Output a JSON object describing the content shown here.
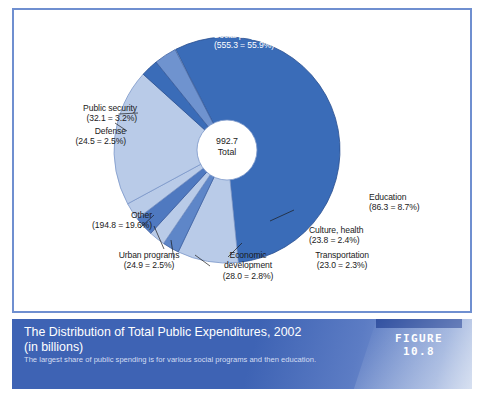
{
  "figure": {
    "label": "FIGURE 10.8",
    "title": "The Distribution of Total Public Expenditures, 2002 (in  billions)",
    "title_line1": "The Distribution of Total Public Expenditures, 2002",
    "title_line2": "(in  billions)",
    "subtitle": "The largest share of public spending is for various social programs and then education.",
    "accent_color": "#3e63b4",
    "bar_color": "#2f4fa0",
    "frame_color": "#6f8fd0"
  },
  "center": {
    "value": "992.7",
    "label": "Total"
  },
  "chart_data": {
    "type": "pie",
    "title": "The Distribution of Total Public Expenditures, 2002 (in  billions)",
    "subtitle": "The largest share of public spending is for various social programs and then education.",
    "units": "billions of dollars",
    "total": 992.7,
    "total_label": "992.7 Total",
    "legend": "labels-with-leader-lines",
    "categories": [
      "Social programs",
      "Education",
      "Culture, health",
      "Transportation",
      "Economic development",
      "Urban programs",
      "Other",
      "Defense",
      "Public security"
    ],
    "values": [
      555.3,
      86.3,
      23.8,
      23.0,
      28.0,
      24.9,
      194.8,
      24.5,
      32.1
    ],
    "percents": [
      55.9,
      8.7,
      2.4,
      2.3,
      2.8,
      2.5,
      19.6,
      2.5,
      3.2
    ],
    "colors": [
      "#3a6cb8",
      "#b9cbe8",
      "#5e86c8",
      "#b9cbe8",
      "#4f79c0",
      "#b9cbe8",
      "#b9cbe8",
      "#3a6cb8",
      "#6f93cf"
    ],
    "slices": [
      {
        "name": "Social programs",
        "value": 555.3,
        "percent": 55.9,
        "label": "Social programs",
        "value_label": "(555.3 = 55.9%)",
        "color": "#3a6cb8"
      },
      {
        "name": "Education",
        "value": 86.3,
        "percent": 8.7,
        "label": "Education",
        "value_label": "(86.3 = 8.7%)",
        "color": "#b9cbe8"
      },
      {
        "name": "Culture, health",
        "value": 23.8,
        "percent": 2.4,
        "label": "Culture, health",
        "value_label": "(23.8 = 2.4%)",
        "color": "#5e86c8"
      },
      {
        "name": "Transportation",
        "value": 23.0,
        "percent": 2.3,
        "label": "Transportation",
        "value_label": "(23.0 = 2.3%)",
        "color": "#b9cbe8"
      },
      {
        "name": "Economic development",
        "value": 28.0,
        "percent": 2.8,
        "label": "Economic development",
        "label_line1": "Economic",
        "label_line2": "development",
        "value_label": "(28.0 = 2.8%)",
        "color": "#4f79c0"
      },
      {
        "name": "Urban programs",
        "value": 24.9,
        "percent": 2.5,
        "label": "Urban programs",
        "value_label": "(24.9 = 2.5%)",
        "color": "#b9cbe8"
      },
      {
        "name": "Other",
        "value": 194.8,
        "percent": 19.6,
        "label": "Other",
        "value_label": "(194.8 = 19.6%)",
        "color": "#b9cbe8"
      },
      {
        "name": "Defense",
        "value": 24.5,
        "percent": 2.5,
        "label": "Defense",
        "value_label": "(24.5 = 2.5%)",
        "color": "#3a6cb8"
      },
      {
        "name": "Public security",
        "value": 32.1,
        "percent": 3.2,
        "label": "Public security",
        "value_label": "(32.1 = 3.2%)",
        "color": "#6f93cf"
      }
    ]
  }
}
